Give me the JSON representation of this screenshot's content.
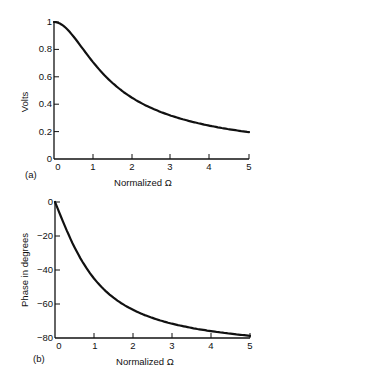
{
  "chart_data": [
    {
      "panel": "(a)",
      "type": "line",
      "title": "",
      "xlabel": "Normalized Ω",
      "ylabel": "Volts",
      "xlim": [
        0,
        5
      ],
      "ylim": [
        0,
        1
      ],
      "x_ticks": [
        "0",
        "1",
        "2",
        "3",
        "4",
        "5"
      ],
      "y_ticks": [
        "0",
        "0.2",
        "0.4",
        "0.6",
        "0.8",
        "1"
      ],
      "grid": false,
      "series": [
        {
          "name": "Magnitude",
          "x": [
            0,
            0.5,
            1,
            1.5,
            2,
            2.5,
            3,
            3.5,
            4,
            4.5,
            5
          ],
          "values": [
            1.0,
            0.89,
            0.71,
            0.55,
            0.45,
            0.37,
            0.32,
            0.27,
            0.24,
            0.22,
            0.2
          ]
        }
      ]
    },
    {
      "panel": "(b)",
      "type": "line",
      "title": "",
      "xlabel": "Normalized Ω",
      "ylabel": "Phase in degrees",
      "xlim": [
        0,
        5
      ],
      "ylim": [
        -80,
        0
      ],
      "x_ticks": [
        "0",
        "1",
        "2",
        "3",
        "4",
        "5"
      ],
      "y_ticks": [
        "0",
        "−20",
        "−40",
        "−60",
        "−80"
      ],
      "grid": false,
      "series": [
        {
          "name": "Phase",
          "x": [
            0,
            0.5,
            1,
            1.5,
            2,
            2.5,
            3,
            3.5,
            4,
            4.5,
            5
          ],
          "values": [
            0,
            -26.6,
            -45,
            -56.3,
            -63.4,
            -68.2,
            -71.6,
            -74.1,
            -76,
            -77.5,
            -78.7
          ]
        }
      ]
    }
  ],
  "panels": {
    "a": {
      "label": "(a)",
      "xlabel": "Normalized Ω",
      "ylabel": "Volts",
      "x_ticks": [
        "0",
        "1",
        "2",
        "3",
        "4",
        "5"
      ],
      "y_ticks": [
        "0",
        "0.2",
        "0.4",
        "0.6",
        "0.8",
        "1"
      ]
    },
    "b": {
      "label": "(b)",
      "xlabel": "Normalized Ω",
      "ylabel": "Phase in degrees",
      "x_ticks": [
        "0",
        "1",
        "2",
        "3",
        "4",
        "5"
      ],
      "y_ticks": [
        "0",
        "−20",
        "−40",
        "−60",
        "−80"
      ]
    }
  },
  "colors": {
    "line": "#111111",
    "background": "#ffffff"
  }
}
